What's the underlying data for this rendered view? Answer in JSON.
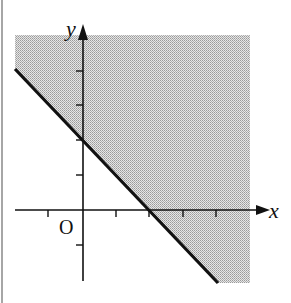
{
  "diagram": {
    "type": "inequality-region",
    "axes": {
      "x_label": "x",
      "y_label": "y",
      "origin_label": "O"
    },
    "boundary_line": "x + y = 2",
    "shaded_region": "x + y >= 2",
    "x_intercept": 2,
    "y_intercept": 2,
    "x_ticks": [
      -1,
      1,
      2,
      3,
      4
    ],
    "y_ticks": [
      -1,
      1,
      2,
      3,
      4
    ],
    "colors": {
      "shade": "#c8c8c8",
      "line": "#111111",
      "axis": "#111111"
    }
  }
}
